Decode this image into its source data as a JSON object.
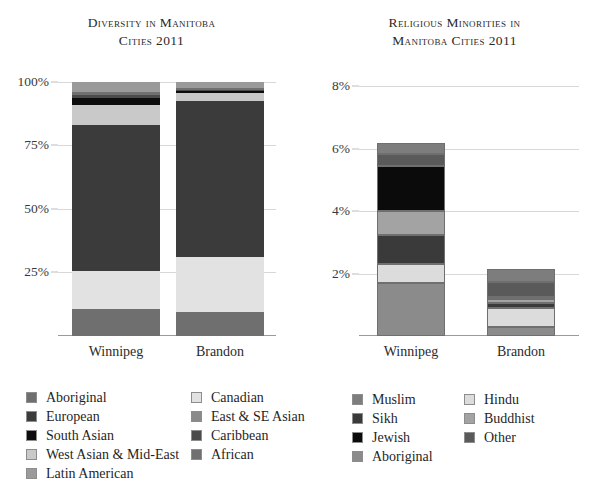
{
  "charts": {
    "left": {
      "title_line1": "Diversity in Manitoba",
      "title_line2": "Cities 2011",
      "yticks": [
        "100%",
        "75%",
        "50%",
        "25%"
      ],
      "xlabels": [
        "Winnipeg",
        "Brandon"
      ],
      "legend": [
        {
          "label": "Aboriginal",
          "color": "#6f6f6f"
        },
        {
          "label": "European",
          "color": "#3b3b3b"
        },
        {
          "label": "South Asian",
          "color": "#0d0d0d"
        },
        {
          "label": "West Asian & Mid-East",
          "color": "#c9c9c9"
        },
        {
          "label": "Latin American",
          "color": "#9a9a9a"
        },
        {
          "label": "Canadian",
          "color": "#e2e2e2"
        },
        {
          "label": "East & SE Asian",
          "color": "#8a8a8a"
        },
        {
          "label": "Caribbean",
          "color": "#4b4b4b"
        },
        {
          "label": "African",
          "color": "#707070"
        }
      ]
    },
    "right": {
      "title_line1": "Religious Minorities in",
      "title_line2": "Manitoba Cities 2011",
      "yticks": [
        "8%",
        "6%",
        "4%",
        "2%"
      ],
      "xlabels": [
        "Winnipeg",
        "Brandon"
      ],
      "legend": [
        {
          "label": "Muslim",
          "color": "#7d7d7d"
        },
        {
          "label": "Sikh",
          "color": "#3a3a3a"
        },
        {
          "label": "Jewish",
          "color": "#0b0b0b"
        },
        {
          "label": "Aboriginal",
          "color": "#8b8b8b"
        },
        {
          "label": "Hindu",
          "color": "#dcdcdc"
        },
        {
          "label": "Buddhist",
          "color": "#a3a3a3"
        },
        {
          "label": "Other",
          "color": "#5a5a5a"
        }
      ]
    }
  },
  "chart_data": [
    {
      "type": "bar",
      "stacked": true,
      "percent": true,
      "title": "Diversity in Manitoba Cities 2011",
      "xlabel": "",
      "ylabel": "",
      "ylim": [
        0,
        103
      ],
      "yticks": [
        25,
        50,
        75,
        100
      ],
      "ytick_labels": [
        "25%",
        "50%",
        "75%",
        "100%"
      ],
      "grid": true,
      "legend_position": "below-left",
      "categories": [
        "Winnipeg",
        "Brandon"
      ],
      "series": [
        {
          "name": "Aboriginal",
          "color": "#6f6f6f",
          "values": [
            10.5,
            9.5
          ]
        },
        {
          "name": "Canadian",
          "color": "#e2e2e2",
          "values": [
            15.0,
            21.5
          ]
        },
        {
          "name": "European",
          "color": "#3b3b3b",
          "values": [
            57.5,
            61.5
          ]
        },
        {
          "name": "East & SE Asian",
          "color": "#8a8a8a",
          "values": [
            0.0,
            0.0
          ]
        },
        {
          "name": "South Asian",
          "color": "#c9c9c9",
          "values": [
            8.0,
            3.0
          ]
        },
        {
          "name": "West Asian & Mid-East",
          "color": "#0d0d0d",
          "values": [
            2.5,
            0.7
          ]
        },
        {
          "name": "Caribbean",
          "color": "#4b4b4b",
          "values": [
            1.2,
            0.6
          ]
        },
        {
          "name": "African",
          "color": "#707070",
          "values": [
            1.3,
            0.8
          ]
        },
        {
          "name": "Latin American",
          "color": "#9a9a9a",
          "values": [
            4.0,
            2.4
          ]
        }
      ]
    },
    {
      "type": "bar",
      "stacked": true,
      "percent": true,
      "title": "Religious Minorities in Manitoba Cities 2011",
      "xlabel": "",
      "ylabel": "",
      "ylim": [
        0,
        8.4
      ],
      "yticks": [
        2,
        4,
        6,
        8
      ],
      "ytick_labels": [
        "2%",
        "4%",
        "6%",
        "8%"
      ],
      "grid": true,
      "legend_position": "below-right",
      "categories": [
        "Winnipeg",
        "Brandon"
      ],
      "series": [
        {
          "name": "Aboriginal",
          "color": "#8b8b8b",
          "values": [
            1.7,
            0.28
          ]
        },
        {
          "name": "Hindu",
          "color": "#dcdcdc",
          "values": [
            0.6,
            0.62
          ]
        },
        {
          "name": "Sikh",
          "color": "#3a3a3a",
          "values": [
            0.95,
            0.16
          ]
        },
        {
          "name": "Buddhist",
          "color": "#a3a3a3",
          "values": [
            0.75,
            0.12
          ]
        },
        {
          "name": "Jewish",
          "color": "#0b0b0b",
          "values": [
            1.45,
            0.08
          ]
        },
        {
          "name": "Other",
          "color": "#5a5a5a",
          "values": [
            0.4,
            0.48
          ]
        },
        {
          "name": "Muslim",
          "color": "#7d7d7d",
          "values": [
            0.35,
            0.4
          ]
        }
      ],
      "totals": [
        6.2,
        2.14
      ]
    }
  ]
}
